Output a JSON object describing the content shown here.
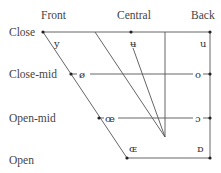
{
  "chart": {
    "columns": [
      {
        "label": "Front"
      },
      {
        "label": "Central"
      },
      {
        "label": "Back"
      }
    ],
    "rows": [
      {
        "label": "Close"
      },
      {
        "label": "Close-mid"
      },
      {
        "label": "Open-mid"
      },
      {
        "label": "Open"
      }
    ],
    "vowels": [
      {
        "symbol": "y"
      },
      {
        "symbol": "ʉ"
      },
      {
        "symbol": "u"
      },
      {
        "symbol": "ø"
      },
      {
        "symbol": "o"
      },
      {
        "symbol": "œ"
      },
      {
        "symbol": "ɔ"
      },
      {
        "symbol": "ɶ"
      },
      {
        "symbol": "ɒ"
      }
    ],
    "line_color": "#555555",
    "dot_color": "#222222"
  }
}
